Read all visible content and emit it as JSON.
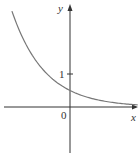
{
  "chart_data": {
    "type": "line",
    "title": "",
    "xlabel": "x",
    "ylabel": "y",
    "tick_labels": {
      "origin": "0",
      "y_tick": "1"
    },
    "function": "y = 0.5·e^(-x)",
    "series": [
      {
        "name": "curve",
        "x": [
          -1.76,
          -1.5,
          -1.0,
          -0.5,
          0,
          0.5,
          1.0,
          1.5,
          2.0
        ],
        "values": [
          2.9,
          2.24,
          1.36,
          0.82,
          0.5,
          0.3,
          0.18,
          0.11,
          0.07
        ]
      }
    ],
    "xlim": [
      -2.1,
      2.05
    ],
    "ylim": [
      -1.6,
      3.1
    ],
    "grid": false,
    "legend": null,
    "colors": {
      "axes": "#333333",
      "curve": "#777777"
    }
  }
}
